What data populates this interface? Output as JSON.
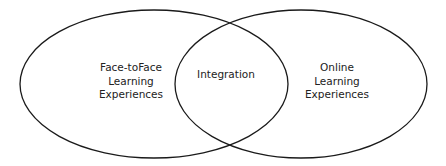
{
  "diagram": {
    "type": "venn",
    "stroke_color": "#1a1a1a",
    "background": "#ffffff",
    "sets": [
      {
        "id": "left",
        "label_lines": [
          "Face-toFace",
          "Learning",
          "Experiences"
        ]
      },
      {
        "id": "right",
        "label_lines": [
          "Online",
          "Learning",
          "Experiences"
        ]
      }
    ],
    "intersection": {
      "label": "Integration"
    }
  }
}
